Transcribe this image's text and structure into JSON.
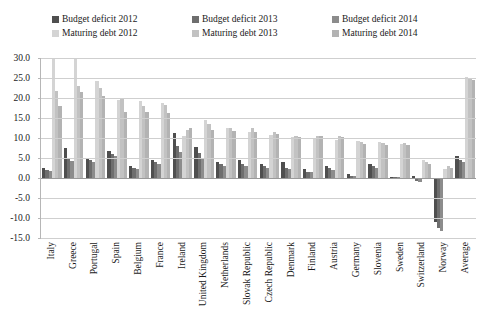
{
  "chart_data": {
    "type": "bar",
    "title": "",
    "subtitle": "",
    "xlabel": "",
    "ylabel": "",
    "ylim": [
      -15.0,
      30.0
    ],
    "ytick_step": 5.0,
    "ytick_labels": [
      "30.0",
      "25.0",
      "20.0",
      "15.0",
      "10.0",
      "5.0",
      "0.0",
      "-5.0",
      "-10.0",
      "-15.0"
    ],
    "ytick_values": [
      30.0,
      25.0,
      20.0,
      15.0,
      10.0,
      5.0,
      0.0,
      -5.0,
      -10.0,
      -15.0
    ],
    "grid": true,
    "legend_position": "top",
    "orientation": "vertical",
    "grouping": "clustered",
    "categories": [
      "Italy",
      "Greece",
      "Portugal",
      "Spain",
      "Belgium",
      "France",
      "Ireland",
      "United Kingdom",
      "Netherlands",
      "Slovak Republic",
      "Czech Republic",
      "Denmark",
      "Finland",
      "Austria",
      "Germany",
      "Slovenia",
      "Sweden",
      "Switzerland",
      "Norway",
      "Average"
    ],
    "series": [
      {
        "name": "Budget deficit 2012",
        "color": "#4f4f4f",
        "values": [
          2.6,
          7.5,
          5.0,
          6.8,
          3.0,
          4.5,
          11.2,
          7.8,
          4.0,
          4.6,
          3.4,
          4.0,
          2.2,
          3.0,
          1.0,
          3.4,
          0.2,
          0.6,
          -11.0,
          5.4
        ]
      },
      {
        "name": "Budget deficit 2013",
        "color": "#6e6e6e",
        "values": [
          2.0,
          5.0,
          4.6,
          6.0,
          2.6,
          4.0,
          8.0,
          6.2,
          3.4,
          3.6,
          3.0,
          2.6,
          1.6,
          2.4,
          0.6,
          3.0,
          0.2,
          -0.8,
          -12.6,
          4.6
        ]
      },
      {
        "name": "Budget deficit 2014",
        "color": "#8c8c8c",
        "values": [
          1.8,
          4.2,
          4.0,
          5.4,
          2.2,
          3.6,
          6.4,
          5.0,
          3.0,
          3.0,
          2.6,
          2.2,
          1.4,
          2.0,
          0.4,
          2.6,
          0.2,
          -1.0,
          -13.2,
          4.0
        ]
      },
      {
        "name": "Maturing debt 2012",
        "color": "#d4d4d4",
        "values": [
          30.0,
          29.8,
          24.2,
          19.6,
          19.2,
          18.8,
          10.4,
          14.4,
          12.6,
          11.6,
          10.8,
          10.2,
          10.0,
          9.6,
          9.2,
          9.0,
          8.4,
          4.4,
          2.2,
          25.2
        ]
      },
      {
        "name": "Maturing debt 2013",
        "color": "#c2c2c2",
        "values": [
          21.8,
          23.0,
          22.6,
          20.0,
          18.0,
          18.2,
          12.0,
          13.6,
          12.6,
          12.4,
          11.6,
          10.4,
          10.4,
          10.6,
          9.0,
          8.8,
          8.8,
          4.0,
          3.0,
          25.0
        ]
      },
      {
        "name": "Maturing debt 2014",
        "color": "#b3b3b3",
        "values": [
          18.0,
          21.6,
          20.6,
          16.4,
          16.6,
          16.2,
          12.6,
          12.0,
          11.8,
          11.4,
          11.0,
          10.2,
          10.6,
          10.2,
          8.6,
          8.2,
          8.2,
          3.4,
          2.6,
          24.6
        ]
      }
    ]
  },
  "legend": {
    "items": [
      {
        "label": "Budget deficit 2012",
        "color": "#4f4f4f"
      },
      {
        "label": "Budget deficit 2013",
        "color": "#6e6e6e"
      },
      {
        "label": "Budget deficit 2014",
        "color": "#8c8c8c"
      },
      {
        "label": "Maturing debt 2012",
        "color": "#d4d4d4"
      },
      {
        "label": "Maturing debt 2013",
        "color": "#c2c2c2"
      },
      {
        "label": "Maturing debt 2014",
        "color": "#b3b3b3"
      }
    ]
  }
}
